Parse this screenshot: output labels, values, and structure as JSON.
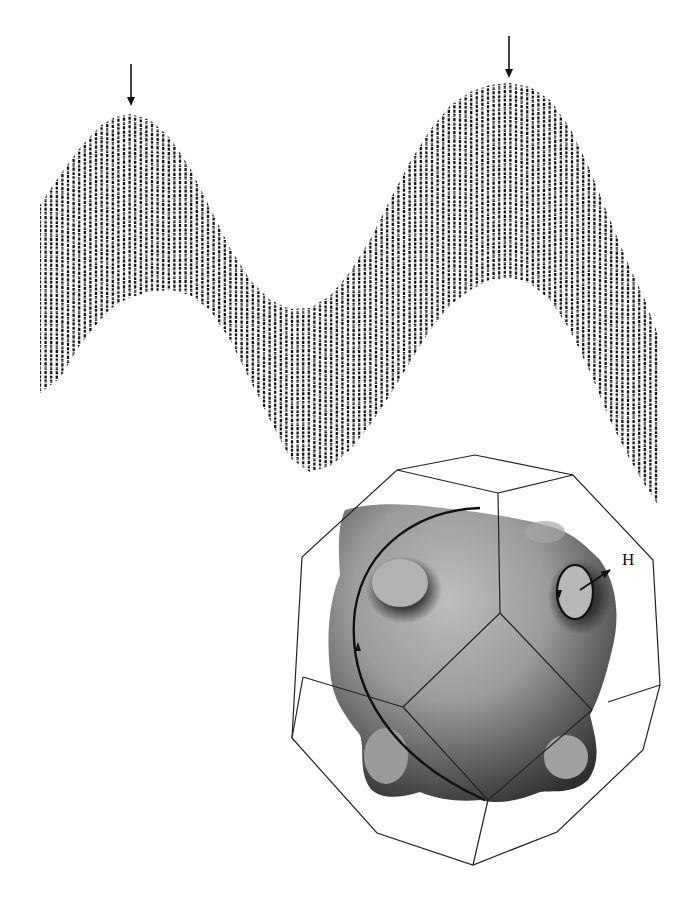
{
  "figure": {
    "background": "#ffffff",
    "ink_color": "#111111",
    "waveform": {
      "description": "Oscillation trace (de Haas-van Alphen type) showing fast oscillations modulated by a slow beat envelope",
      "x_start": 40,
      "x_end": 658,
      "stripe_spacing": 5.6,
      "band_thickness": 195,
      "envelope_upper": [
        [
          40,
          205
        ],
        [
          60,
          175
        ],
        [
          80,
          148
        ],
        [
          100,
          126
        ],
        [
          115,
          117
        ],
        [
          131,
          114
        ],
        [
          150,
          120
        ],
        [
          170,
          138
        ],
        [
          190,
          168
        ],
        [
          210,
          208
        ],
        [
          230,
          248
        ],
        [
          250,
          280
        ],
        [
          270,
          300
        ],
        [
          290,
          309
        ],
        [
          310,
          308
        ],
        [
          330,
          296
        ],
        [
          350,
          272
        ],
        [
          370,
          240
        ],
        [
          390,
          200
        ],
        [
          410,
          162
        ],
        [
          430,
          130
        ],
        [
          450,
          106
        ],
        [
          470,
          92
        ],
        [
          490,
          85
        ],
        [
          509,
          83
        ],
        [
          530,
          87
        ],
        [
          550,
          100
        ],
        [
          570,
          128
        ],
        [
          590,
          170
        ],
        [
          610,
          220
        ],
        [
          630,
          268
        ],
        [
          645,
          300
        ],
        [
          658,
          335
        ]
      ],
      "envelope_lower": [
        [
          40,
          393
        ],
        [
          60,
          378
        ],
        [
          80,
          345
        ],
        [
          100,
          320
        ],
        [
          115,
          305
        ],
        [
          131,
          297
        ],
        [
          150,
          292
        ],
        [
          170,
          290
        ],
        [
          190,
          295
        ],
        [
          210,
          310
        ],
        [
          230,
          340
        ],
        [
          250,
          380
        ],
        [
          270,
          420
        ],
        [
          290,
          458
        ],
        [
          310,
          472
        ],
        [
          330,
          466
        ],
        [
          350,
          450
        ],
        [
          370,
          425
        ],
        [
          390,
          395
        ],
        [
          410,
          362
        ],
        [
          430,
          330
        ],
        [
          450,
          305
        ],
        [
          470,
          290
        ],
        [
          490,
          280
        ],
        [
          509,
          278
        ],
        [
          530,
          283
        ],
        [
          550,
          300
        ],
        [
          570,
          330
        ],
        [
          590,
          372
        ],
        [
          610,
          420
        ],
        [
          630,
          460
        ],
        [
          645,
          485
        ],
        [
          658,
          505
        ]
      ],
      "arrows": [
        {
          "name": "left-peak-arrow",
          "x": 131,
          "y_top": 64,
          "y_tip": 106
        },
        {
          "name": "right-peak-arrow",
          "x": 509,
          "y_top": 36,
          "y_tip": 78
        }
      ]
    },
    "brillouin_zone": {
      "description": "Truncated octahedron (Brillouin zone) enclosing a shaded Fermi surface with necks; closed orbits drawn on the surface",
      "outer_vertices": [
        [
          397,
          470
        ],
        [
          475,
          455
        ],
        [
          573,
          475
        ],
        [
          653,
          560
        ],
        [
          660,
          685
        ],
        [
          643,
          750
        ],
        [
          557,
          832
        ],
        [
          473,
          865
        ],
        [
          377,
          833
        ],
        [
          292,
          738
        ],
        [
          302,
          557
        ]
      ],
      "inner_edges": [
        [
          [
            397,
            470
          ],
          [
            498,
            493
          ]
        ],
        [
          [
            573,
            475
          ],
          [
            498,
            493
          ]
        ],
        [
          [
            498,
            493
          ],
          [
            500,
            613
          ]
        ],
        [
          [
            500,
            613
          ],
          [
            403,
            707
          ]
        ],
        [
          [
            500,
            613
          ],
          [
            592,
            710
          ]
        ],
        [
          [
            403,
            707
          ],
          [
            488,
            800
          ]
        ],
        [
          [
            592,
            710
          ],
          [
            488,
            800
          ]
        ],
        [
          [
            303,
            677
          ],
          [
            403,
            707
          ]
        ],
        [
          [
            303,
            677
          ],
          [
            292,
            738
          ]
        ],
        [
          [
            608,
            702
          ],
          [
            660,
            685
          ]
        ],
        [
          [
            488,
            800
          ],
          [
            473,
            865
          ]
        ]
      ],
      "surface_colors": {
        "light": "#b4b4b4",
        "mid": "#8a8a8a",
        "dark": "#3a3a3a",
        "neck": "#a8a8a8"
      },
      "field_label": "H",
      "field_label_pos": [
        622,
        559
      ]
    }
  }
}
